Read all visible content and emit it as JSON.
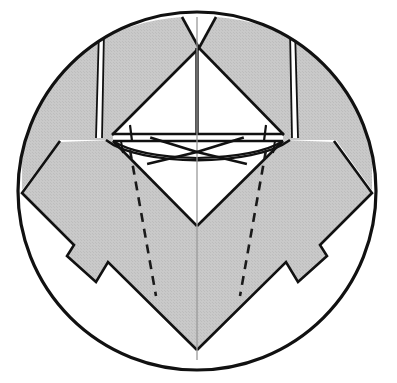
{
  "figure": {
    "kind": "line-drawing",
    "width": 397,
    "height": 383,
    "background_color": "#ffffff",
    "stroke_color": "#111111",
    "shaded_fill_color": "#c6c6c6",
    "white_fill_color": "#ffffff",
    "faint_line_color": "#9a9a9a",
    "outer_circle": {
      "center_x": 197,
      "center_y": 191,
      "radius": 180,
      "stroke_width": 3.2
    },
    "top_notch_triangle": {
      "apex_x": 199,
      "apex_y": 48,
      "left_x": 182,
      "left_y": 17,
      "right_x": 218,
      "right_y": 17
    },
    "center_star": {
      "center_x": 197,
      "center_y": 152,
      "ray_count": 4,
      "ray_length": 52
    },
    "horizontal_band": {
      "y_top": 133,
      "y_bottom": 140,
      "x_left": 113,
      "x_right": 283
    },
    "dashed_lines": {
      "left_top_x": 130,
      "left_top_y": 150,
      "left_bottom_x": 156,
      "left_bottom_y": 296,
      "right_top_x": 266,
      "right_top_y": 150,
      "right_bottom_x": 240,
      "right_bottom_y": 296,
      "dash_pattern": "9 7",
      "stroke_width": 2.6
    },
    "vertical_axis": {
      "x": 197,
      "y_top": 17,
      "y_bottom": 360
    },
    "thin_slivers": {
      "left_top_x": 101,
      "left_top_y": 31,
      "left_bottom_x": 98,
      "left_bottom_y": 137,
      "right_top_x": 293,
      "right_top_y": 31,
      "right_bottom_x": 296,
      "right_bottom_y": 137,
      "width": 5
    },
    "bottom_v_apex": {
      "x": 197,
      "y": 350
    },
    "side_flaps": {
      "left_outer_x": 22,
      "right_outer_x": 372,
      "notch_y": 200,
      "tail_tip_y": 283
    }
  }
}
